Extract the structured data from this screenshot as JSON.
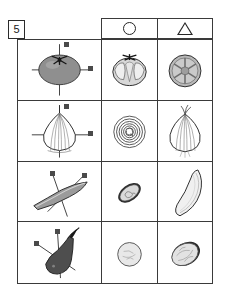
{
  "page": {
    "question_number": "5",
    "background": "#ffffff",
    "ink": "#3a3a3a"
  },
  "header": {
    "symbols": [
      {
        "name": "circle-symbol",
        "glyph": "○",
        "label": "○"
      },
      {
        "name": "triangle-symbol",
        "glyph": "△",
        "label": "△"
      }
    ]
  },
  "table": {
    "columns": [
      {
        "key": "whole",
        "header": ""
      },
      {
        "key": "circle",
        "header": "○"
      },
      {
        "key": "triangle",
        "header": "△"
      }
    ],
    "rows": [
      {
        "name": "tomato",
        "whole": {
          "label": "tomato-with-axes",
          "axis_labels": [
            "縦",
            "横"
          ],
          "fill": "#8a8a8a"
        },
        "circle": {
          "label": "tomato-longitudinal-section",
          "fill": "#d6d6d6"
        },
        "triangle": {
          "label": "tomato-transverse-section",
          "fill": "#b4b4b4"
        }
      },
      {
        "name": "onion",
        "whole": {
          "label": "onion-with-axes",
          "axis_labels": [
            "縦",
            "横"
          ],
          "fill": "#ffffff"
        },
        "circle": {
          "label": "onion-transverse-rings-section",
          "fill": "#ffffff"
        },
        "triangle": {
          "label": "onion-longitudinal-section",
          "fill": "#ffffff"
        }
      },
      {
        "name": "cucumber",
        "whole": {
          "label": "cucumber-with-axes",
          "axis_labels": [
            "縦",
            "横"
          ],
          "fill": "#9a9a9a"
        },
        "circle": {
          "label": "cucumber-oval-section",
          "fill": "#cfcfcf"
        },
        "triangle": {
          "label": "cucumber-whole-long",
          "fill": "#ededed"
        }
      },
      {
        "name": "eggplant",
        "whole": {
          "label": "eggplant-with-axes",
          "axis_labels": [
            "縦",
            "横"
          ],
          "fill": "#4a4a4a"
        },
        "circle": {
          "label": "eggplant-round-section",
          "fill": "#e4e4e4"
        },
        "triangle": {
          "label": "eggplant-oval-section",
          "fill": "#dcdcdc"
        }
      }
    ]
  }
}
